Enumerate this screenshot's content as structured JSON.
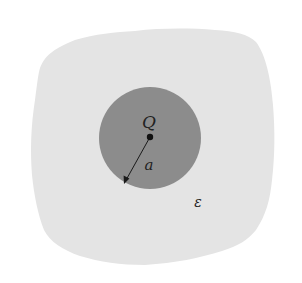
{
  "diagram": {
    "type": "physics-figure",
    "labels": {
      "charge": "Q",
      "radius": "a",
      "permittivity": "ε"
    },
    "colors": {
      "background": "#ffffff",
      "medium": "#e4e4e4",
      "sphere": "#8c8c8c",
      "ink": "#1a1a1a"
    },
    "geometry": {
      "sphere_center": [
        150,
        138
      ],
      "sphere_radius": 51,
      "charge_point": [
        150,
        137
      ],
      "radius_arrow_tip": [
        124,
        184
      ]
    }
  }
}
